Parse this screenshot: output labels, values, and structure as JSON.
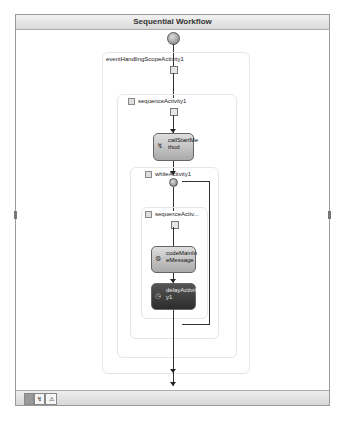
{
  "designer": {
    "title": "Sequential Workflow",
    "containers": {
      "event_scope": {
        "label": "eventHandlingScopeActivity1"
      },
      "sequence1": {
        "label": "sequenceActivity1"
      },
      "while1": {
        "label": "whileActivity1"
      },
      "sequence2": {
        "label": "sequenceActiv..."
      }
    },
    "activities": {
      "call_start": {
        "label": "callStartMe thod",
        "line1": "callStartMe",
        "line2": "thod",
        "icon": "method-call-icon"
      },
      "code_main": {
        "label": "codeMainIn eMessage",
        "line1": "codeMainIn",
        "line2": "eMessage",
        "icon": "code-icon"
      },
      "delay": {
        "label": "delayActivit y1",
        "line1": "delayActivit",
        "line2": "y1",
        "icon": "clock-icon"
      }
    },
    "colors": {
      "frame_border": "#9a9a9a",
      "title_bar": "#d9d9d9",
      "activity_light": "#a9a9a9",
      "activity_dark": "#2c2c2c",
      "connector": "#333333"
    }
  },
  "view_tabs": [
    {
      "label": "",
      "icon": "workflow-view-icon",
      "active": true
    },
    {
      "label": "",
      "icon": "cancel-handler-view-icon",
      "active": false
    },
    {
      "label": "",
      "icon": "fault-handler-view-icon",
      "active": false
    }
  ]
}
